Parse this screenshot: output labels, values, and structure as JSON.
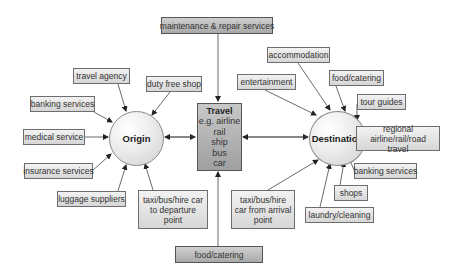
{
  "diagram": {
    "type": "flow",
    "colors": {
      "box_fill_light": "#e4e4e4",
      "box_fill_dark": "#b8b8b8",
      "border": "#6e6e6e",
      "arrow": "#333333",
      "text": "#333333"
    },
    "nodes": {
      "origin": {
        "label": "Origin"
      },
      "destination": {
        "label": "Destination"
      },
      "travel": {
        "title": "Travel",
        "lines": [
          "e.g. airline",
          "rail",
          "ship",
          "bus",
          "car"
        ]
      }
    },
    "origin_services": [
      {
        "label": "travel agency"
      },
      {
        "label": "banking services"
      },
      {
        "label": "medical service"
      },
      {
        "label": "insurance services"
      },
      {
        "label": "luggage suppliers"
      },
      {
        "label": "duty free shop"
      },
      {
        "label_lines": [
          "taxi/bus/hire car",
          "to departure",
          "point"
        ]
      }
    ],
    "travel_services": [
      {
        "label": "maintenance & repair services"
      },
      {
        "label": "food/catering"
      }
    ],
    "destination_services": [
      {
        "label": "entertainment"
      },
      {
        "label": "accommodation"
      },
      {
        "label": "food/catering"
      },
      {
        "label": "tour guides"
      },
      {
        "label_lines": [
          "regional",
          "airline/rail/road travel"
        ]
      },
      {
        "label": "banking services"
      },
      {
        "label": "shops"
      },
      {
        "label": "laundry/cleaning"
      },
      {
        "label_lines": [
          "taxi/bus/hire",
          "car from arrival",
          "point"
        ]
      }
    ]
  }
}
